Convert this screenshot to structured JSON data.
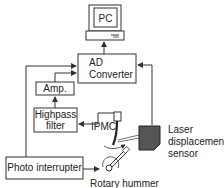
{
  "diagram": {
    "blocks": {
      "pc": {
        "label": "PC"
      },
      "ad_converter": {
        "label_line1": "AD",
        "label_line2": "Converter"
      },
      "amp": {
        "label": "Amp."
      },
      "highpass_filter": {
        "label_line1": "Highpass",
        "label_line2": "filter"
      },
      "photo_interrupter": {
        "label": "Photo interrupter"
      }
    },
    "labels": {
      "ipmc": "IPMC",
      "laser_line1": "Laser",
      "laser_line2": "displacement",
      "laser_line3": "sensor",
      "rotary": "Rotary hummer"
    },
    "colors": {
      "line": "#333333",
      "sensor_fill": "#555555",
      "background": "#ffffff"
    }
  }
}
